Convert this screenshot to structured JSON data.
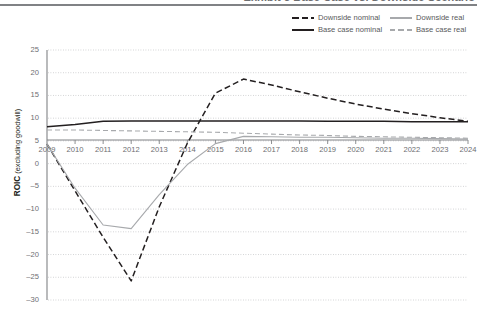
{
  "title": "Exhibit 5 Base Case vs. Downside Scenario",
  "legend": {
    "position": "top-right",
    "items": [
      {
        "label": "Downside nominal",
        "style": "dashed",
        "color": "#231f20"
      },
      {
        "label": "Downside real",
        "style": "solid",
        "color": "#a7a9ac"
      },
      {
        "label": "Base case nominal",
        "style": "solid",
        "color": "#231f20"
      },
      {
        "label": "Base case real",
        "style": "dashed",
        "color": "#a7a9ac"
      }
    ]
  },
  "axis": {
    "ylabel_bold": "ROIC",
    "ylabel_rest": " (excluding goodwill)",
    "yticks": [
      "25",
      "20",
      "15",
      "10",
      "5",
      "0",
      "–5",
      "–10",
      "–15",
      "–20",
      "–25",
      "–30"
    ],
    "xticks": [
      "2009",
      "2010",
      "2011",
      "2012",
      "2013",
      "2014",
      "2015",
      "2016",
      "2017",
      "2018",
      "2019",
      "2020",
      "2021",
      "2022",
      "2023",
      "2024"
    ]
  },
  "chart_data": {
    "type": "line",
    "title": "Exhibit 5 Base Case vs. Downside Scenario",
    "xlabel": "",
    "ylabel": "ROIC (excluding goodwill)",
    "xlim": [
      2009,
      2024
    ],
    "ylim": [
      -30,
      25
    ],
    "yticks": [
      25,
      20,
      15,
      10,
      5,
      0,
      -5,
      -10,
      -15,
      -20,
      -25,
      -30
    ],
    "grid": "horizontal-dotted",
    "legend_position": "top-right",
    "x": [
      2009,
      2010,
      2011,
      2012,
      2013,
      2014,
      2015,
      2016,
      2017,
      2018,
      2019,
      2020,
      2021,
      2022,
      2023,
      2024
    ],
    "series": [
      {
        "name": "Downside nominal",
        "style": "dashed",
        "color": "#231f20",
        "values": [
          4.3,
          -6.0,
          -16.2,
          -25.8,
          -9.5,
          4.5,
          15.5,
          18.6,
          17.3,
          15.8,
          14.4,
          13.1,
          12.0,
          11.0,
          10.1,
          9.3
        ]
      },
      {
        "name": "Downside real",
        "style": "solid",
        "color": "#a7a9ac",
        "values": [
          4.3,
          -5.4,
          -13.5,
          -14.3,
          -6.8,
          -0.2,
          4.4,
          6.0,
          5.9,
          5.8,
          5.8,
          5.7,
          5.6,
          5.6,
          5.5,
          5.4
        ]
      },
      {
        "name": "Base case nominal",
        "style": "solid",
        "color": "#231f20",
        "values": [
          8.1,
          8.6,
          9.3,
          9.4,
          9.4,
          9.4,
          9.4,
          9.4,
          9.4,
          9.4,
          9.3,
          9.3,
          9.3,
          9.2,
          9.2,
          9.2
        ]
      },
      {
        "name": "Base case real",
        "style": "dashed",
        "color": "#a7a9ac",
        "values": [
          7.4,
          7.4,
          7.3,
          7.2,
          7.1,
          7.0,
          6.9,
          6.7,
          6.5,
          6.3,
          6.2,
          6.0,
          5.9,
          5.8,
          5.7,
          5.6
        ]
      }
    ]
  }
}
